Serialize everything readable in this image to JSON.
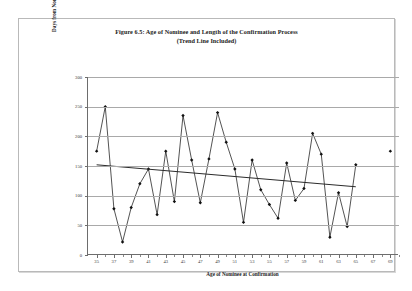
{
  "figure": {
    "title_line1": "Figure 6.5: Age of Nominee and Length of the Confirmation Process",
    "title_line2": "(Trend Line Included)",
    "xaxis_title": "Age of Nominee at Confirmation",
    "yaxis_title": "Days from Nomination to Confirmation"
  },
  "chart_data": {
    "type": "scatter",
    "title": "Figure 6.5: Age of Nominee and Length of the Confirmation Process (Trend Line Included)",
    "xlabel": "Age of Nominee at Confirmation",
    "ylabel": "Days from Nomination to Confirmation",
    "xlim": [
      34,
      70
    ],
    "ylim": [
      0,
      300
    ],
    "ytick_labels": [
      "0",
      "50",
      "100",
      "150",
      "200",
      "250",
      "300"
    ],
    "ytick_values": [
      0,
      50,
      100,
      150,
      200,
      250,
      300
    ],
    "xtick_labels": [
      "35",
      "37",
      "39",
      "41",
      "43",
      "45",
      "47",
      "49",
      "51",
      "53",
      "55",
      "57",
      "59",
      "61",
      "63",
      "65",
      "67",
      "69"
    ],
    "xtick_values": [
      35,
      37,
      39,
      41,
      43,
      45,
      47,
      49,
      51,
      53,
      55,
      57,
      59,
      61,
      63,
      65,
      67,
      69
    ],
    "grid": true,
    "legend": "none",
    "markers": "filled-diamond",
    "connected": true,
    "series": [
      {
        "name": "Days from Nomination to Confirmation",
        "x": [
          35,
          36,
          37,
          38,
          39,
          40,
          41,
          42,
          43,
          44,
          45,
          46,
          47,
          48,
          49,
          50,
          51,
          52,
          53,
          54,
          55,
          56,
          57,
          58,
          59,
          60,
          61,
          62,
          63,
          64,
          65
        ],
        "values": [
          175,
          250,
          78,
          22,
          80,
          120,
          145,
          68,
          175,
          90,
          235,
          160,
          88,
          162,
          240,
          190,
          145,
          55,
          160,
          110,
          85,
          62,
          155,
          92,
          112,
          205,
          170,
          30,
          105,
          48,
          152
        ]
      },
      {
        "name": "Outlier point",
        "x": [
          69
        ],
        "values": [
          175
        ],
        "connected": false
      },
      {
        "name": "Trend Line",
        "type": "line",
        "x": [
          35,
          65
        ],
        "values": [
          152,
          115
        ]
      }
    ]
  }
}
